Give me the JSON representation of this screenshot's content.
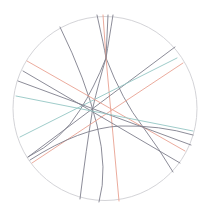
{
  "diagram": {
    "type": "line-arrangement-in-disk",
    "colors": {
      "background": "#ffffff",
      "boundary": "#d4d4d8",
      "gray": "#7f7f8c",
      "red": "#e9a192",
      "teal": "#94c6c4"
    },
    "boundary": {
      "cx": 105,
      "cy": 108.5,
      "r": 92
    },
    "lines": [
      {
        "id": "g1",
        "color": "gray",
        "d": "M60,27 Q86,80 97,125 T99,202"
      },
      {
        "id": "g2",
        "color": "gray",
        "d": "M97,15 Q104,46 106,58 Q122,100 143,127 Q160,150 173,172"
      },
      {
        "id": "g3",
        "color": "gray",
        "d": "M113,15 Q109,40 106,58 Q94,88 80,110 Q62,140 28,157"
      },
      {
        "id": "r1",
        "color": "red",
        "d": "M103,15 L106,58 L119,201"
      },
      {
        "id": "g4",
        "color": "gray",
        "d": "M108,15 L106,58 Q98,85 93,107 Q86,150 80,199"
      },
      {
        "id": "g5",
        "color": "gray",
        "d": "M175,47 L28,157"
      },
      {
        "id": "t1",
        "color": "teal",
        "d": "M177,58 L20,137"
      },
      {
        "id": "r2",
        "color": "red",
        "d": "M183,63 L32,163"
      },
      {
        "id": "r3",
        "color": "red",
        "d": "M27,61 L185,151"
      },
      {
        "id": "g6",
        "color": "gray",
        "d": "M23,71 L180,163"
      },
      {
        "id": "g7",
        "color": "gray",
        "d": "M18,81 L191,145"
      },
      {
        "id": "t2",
        "color": "teal",
        "d": "M16,96 L193,131"
      },
      {
        "id": "g8",
        "color": "gray",
        "d": "M30,160 Q80,128 120,126 Q160,125 193,135"
      }
    ]
  }
}
